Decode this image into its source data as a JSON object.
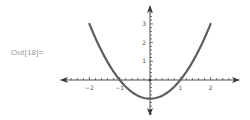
{
  "cell": {
    "output_label": "Out[18]="
  },
  "colors": {
    "axis": "#3a3a3a",
    "curve": "#5e5e5e",
    "label": "#555555",
    "prompt": "#9a9a9a"
  },
  "chart_data": {
    "type": "line",
    "title": "",
    "function": "x^2 - 1",
    "xlabel": "",
    "ylabel": "",
    "xlim": [
      -2.9,
      2.9
    ],
    "ylim": [
      -1.9,
      4.0
    ],
    "grid": false,
    "legend": null,
    "axes_style": "arrowed axes through origin",
    "x_ticks": [
      -2,
      -1,
      1,
      2
    ],
    "x_tick_labels": [
      "−2",
      "−1",
      "1",
      "2"
    ],
    "x_minor_tick_step": 0.2,
    "y_ticks": [
      1,
      2,
      3
    ],
    "y_tick_labels": [
      "1",
      "2",
      "3"
    ],
    "y_minor_tick_step": 0.2,
    "series": [
      {
        "name": "x^2 - 1",
        "x": [
          -2,
          -1.5,
          -1,
          -0.5,
          0,
          0.5,
          1,
          1.5,
          2
        ],
        "y": [
          3,
          1.25,
          0,
          -0.75,
          -1,
          -0.75,
          0,
          1.25,
          3
        ]
      }
    ]
  }
}
